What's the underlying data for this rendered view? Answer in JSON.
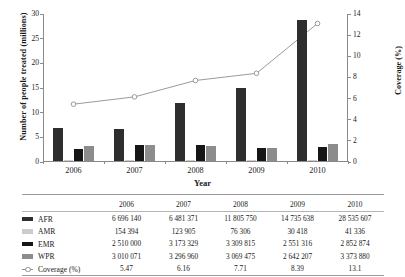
{
  "chart_data": {
    "type": "bar",
    "title": "",
    "xlabel": "Year",
    "ylabel": "Number of people treated (millions)",
    "y2label": "Coverage (%)",
    "categories": [
      "2006",
      "2007",
      "2008",
      "2009",
      "2010"
    ],
    "ylim": [
      0,
      30
    ],
    "yticks": [
      "0",
      "5",
      "10",
      "15",
      "20",
      "25",
      "30"
    ],
    "y2lim": [
      0,
      14
    ],
    "y2ticks": [
      "0",
      "2",
      "4",
      "6",
      "8",
      "10",
      "12",
      "14"
    ],
    "grid": false,
    "legend_position": "table-below",
    "series": [
      {
        "name": "AFR",
        "type": "bar",
        "axis": "left",
        "color": "#2e2e2e",
        "values": [
          6.69614,
          6.481371,
          11.80575,
          14.735638,
          28.535607
        ],
        "labels": [
          "6 696 140",
          "6 481 371",
          "11 805 750",
          "14 735 638",
          "28 535 607"
        ]
      },
      {
        "name": "AMR",
        "type": "bar",
        "axis": "left",
        "color": "#cccccc",
        "values": [
          0.154394,
          0.123905,
          0.076306,
          0.030418,
          0.041336
        ],
        "labels": [
          "154 394",
          "123 905",
          "76 306",
          "30 418",
          "41 336"
        ]
      },
      {
        "name": "EMR",
        "type": "bar",
        "axis": "left",
        "color": "#161616",
        "values": [
          2.51,
          3.173329,
          3.309815,
          2.551316,
          2.852874
        ],
        "labels": [
          "2 510 000",
          "3 173 329",
          "3 309 815",
          "2 551 316",
          "2 852 874"
        ]
      },
      {
        "name": "WPR",
        "type": "bar",
        "axis": "left",
        "color": "#8c8c8c",
        "values": [
          3.010071,
          3.29696,
          3.069475,
          2.642207,
          3.37388
        ],
        "labels": [
          "3 010 071",
          "3 296 960",
          "3 069 475",
          "2 642 207",
          "3 373 880"
        ]
      },
      {
        "name": "Coverage (%)",
        "type": "line",
        "axis": "right",
        "color": "#8f8f8f",
        "marker": "open-circle",
        "values": [
          5.47,
          6.16,
          7.71,
          8.39,
          13.1
        ],
        "labels": [
          "5.47",
          "6.16",
          "7.71",
          "8.39",
          "13.1"
        ]
      }
    ]
  },
  "axes": {
    "y_left_title": "Number of people treated (millions)",
    "y_right_title": "Coverage (%)",
    "x_title": "Year"
  },
  "table": {
    "header": [
      "",
      "2006",
      "2007",
      "2008",
      "2009",
      "2010"
    ],
    "rows": [
      {
        "key": "AFR",
        "values": [
          "6 696 140",
          "6 481 371",
          "11 805 750",
          "14 735 638",
          "28 535 607"
        ]
      },
      {
        "key": "AMR",
        "values": [
          "154 394",
          "123 905",
          "76 306",
          "30 418",
          "41 336"
        ]
      },
      {
        "key": "EMR",
        "values": [
          "2 510 000",
          "3 173 329",
          "3 309 815",
          "2 551 316",
          "2 852 874"
        ]
      },
      {
        "key": "WPR",
        "values": [
          "3 010 071",
          "3 296 960",
          "3 069 475",
          "2 642 207",
          "3 373 880"
        ]
      },
      {
        "key": "Coverage (%)",
        "values": [
          "5.47",
          "6.16",
          "7.71",
          "8.39",
          "13.1"
        ]
      }
    ]
  }
}
